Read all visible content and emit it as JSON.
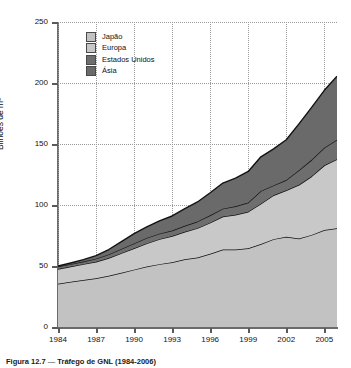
{
  "figure": {
    "caption_number": "Figura 12.7",
    "caption_separator": "—",
    "caption_text": "Tráfego de GNL (1984-2006)"
  },
  "chart_data": {
    "type": "area",
    "stacked": true,
    "title": "Tráfego de GNL (1984-2006)",
    "xlabel": "",
    "ylabel": "Bilhões de m³",
    "xlim": [
      1984,
      2006
    ],
    "ylim": [
      0,
      250
    ],
    "grid": true,
    "legend_position": "top-left",
    "ytick_labels": [
      "0",
      "50",
      "100",
      "150",
      "200",
      "250"
    ],
    "yticks": [
      0,
      50,
      100,
      150,
      200,
      250
    ],
    "xtick_labels": [
      "1984",
      "1987",
      "1990",
      "1993",
      "1996",
      "1999",
      "2002",
      "2005"
    ],
    "xticks": [
      1984,
      1987,
      1990,
      1993,
      1996,
      1999,
      2002,
      2005
    ],
    "x": [
      1984,
      1985,
      1986,
      1987,
      1988,
      1989,
      1990,
      1991,
      1992,
      1993,
      1994,
      1995,
      1996,
      1997,
      1998,
      1999,
      2000,
      2001,
      2002,
      2003,
      2004,
      2005,
      2006
    ],
    "series": [
      {
        "name": "Japão",
        "color": "#c2c2c2",
        "values": [
          35.5,
          37.0,
          38.5,
          40.0,
          42.0,
          44.5,
          47.0,
          49.5,
          51.5,
          53.0,
          55.5,
          57.0,
          60.0,
          63.5,
          63.5,
          64.5,
          68.0,
          72.0,
          74.0,
          72.5,
          75.5,
          79.5,
          81.0
        ]
      },
      {
        "name": "Europa",
        "color": "#c8c8c8",
        "values": [
          12.0,
          12.5,
          13.0,
          13.5,
          14.5,
          16.0,
          17.5,
          19.0,
          20.5,
          21.5,
          22.5,
          24.0,
          25.5,
          27.0,
          28.5,
          30.0,
          33.0,
          36.0,
          38.0,
          44.0,
          48.0,
          53.0,
          56.5
        ]
      },
      {
        "name": "Estados Unidos",
        "color": "#6e6e6e",
        "values": [
          2.0,
          2.0,
          2.2,
          2.5,
          3.0,
          3.5,
          4.0,
          4.5,
          4.5,
          4.5,
          5.0,
          5.5,
          6.0,
          6.5,
          7.0,
          7.5,
          10.5,
          8.0,
          8.5,
          12.0,
          13.5,
          14.5,
          16.0
        ]
      },
      {
        "name": "Ásia",
        "color": "#6a6a6a",
        "values": [
          0.5,
          1.0,
          1.5,
          2.5,
          4.0,
          6.0,
          8.0,
          9.0,
          10.5,
          12.0,
          14.0,
          16.0,
          18.5,
          21.0,
          23.0,
          25.5,
          28.0,
          30.0,
          33.0,
          38.0,
          43.0,
          47.0,
          52.0
        ]
      }
    ],
    "totals": [
      50.0,
      52.5,
      55.2,
      58.5,
      63.5,
      70.0,
      76.5,
      82.0,
      87.0,
      91.0,
      97.0,
      102.5,
      110.0,
      118.0,
      122.0,
      127.5,
      139.5,
      146.0,
      153.5,
      166.5,
      180.0,
      194.0,
      205.5
    ]
  },
  "legend": {
    "items": [
      {
        "label": "Japão",
        "color": "#c2c2c2"
      },
      {
        "label": "Europa",
        "color": "#c8c8c8"
      },
      {
        "label": "Estados Unidos",
        "color": "#6e6e6e"
      },
      {
        "label": "Ásia",
        "color": "#6a6a6a"
      }
    ]
  }
}
